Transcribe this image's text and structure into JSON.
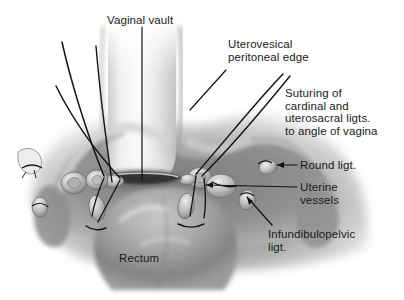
{
  "figure": {
    "title_alt": "Anatomical illustration of pelvic structures after hysterectomy",
    "type": "medical-illustration",
    "palette": {
      "background": "#ffffff",
      "tissue_light": "#d8d8d8",
      "tissue_mid": "#9a9a9a",
      "tissue_dark": "#6a6a6a",
      "tissue_deep": "#4a4a4a",
      "highlight": "#f2f2f2",
      "suture": "#1a1a1a",
      "leader": "#111111",
      "text": "#1b1b1b"
    }
  },
  "labels": [
    {
      "id": "vaginal-vault",
      "text": "Vaginal vault",
      "x": 107,
      "y": 14,
      "align": "left"
    },
    {
      "id": "uterovesical-peritoneal-edge",
      "text": "Uterovesical\nperitoneal edge",
      "x": 228,
      "y": 38,
      "align": "left"
    },
    {
      "id": "suturing-cardinal-uterosacral",
      "text": "Suturing of\ncardinal and\nuterosacral ligts.\nto angle of vagina",
      "x": 285,
      "y": 87,
      "align": "left"
    },
    {
      "id": "round-ligt",
      "text": "Round ligt.",
      "x": 300,
      "y": 159,
      "align": "left"
    },
    {
      "id": "uterine-vessels",
      "text": "Uterine\nvessels",
      "x": 300,
      "y": 181,
      "align": "left"
    },
    {
      "id": "infundibulopelvic-ligt",
      "text": "Infundibulopelvic\nligt.",
      "x": 268,
      "y": 228,
      "align": "left"
    },
    {
      "id": "rectum",
      "text": "Rectum",
      "x": 119,
      "y": 252,
      "align": "left"
    }
  ],
  "leaders": [
    {
      "id": "leader-vaginal-vault",
      "from": [
        142,
        27
      ],
      "to": [
        142,
        181
      ]
    },
    {
      "id": "leader-uterovesical",
      "from": [
        226,
        70
      ],
      "to": [
        190,
        110
      ]
    },
    {
      "id": "leader-round-ligt",
      "from": [
        297,
        165
      ],
      "to": [
        277,
        165
      ]
    },
    {
      "id": "leader-uterine-vessels",
      "from": [
        297,
        187
      ],
      "to": [
        206,
        185
      ]
    },
    {
      "id": "leader-infundibulopelvic",
      "from": [
        272,
        225
      ],
      "to": [
        247,
        197
      ]
    }
  ],
  "structures": [
    {
      "id": "bladder-dome",
      "name": "bladder / vaginal vault column"
    },
    {
      "id": "vaginal-slit",
      "name": "vaginal vault opening"
    },
    {
      "id": "rectum-mass",
      "name": "rectum"
    },
    {
      "id": "pedicle-left",
      "name": "left clamped pedicle cluster"
    },
    {
      "id": "pedicle-right",
      "name": "right clamped pedicle cluster"
    },
    {
      "id": "round-ligament-stump-right",
      "name": "right round ligament stump"
    },
    {
      "id": "round-ligament-stump-left",
      "name": "left round ligament stump"
    },
    {
      "id": "infundibulopelvic-stump",
      "name": "infundibulopelvic ligament stump"
    }
  ],
  "suture_strands": {
    "left_count": 3,
    "right_count": 3,
    "color": "#141414"
  }
}
